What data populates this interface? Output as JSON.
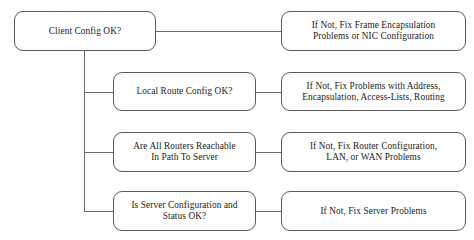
{
  "diagram": {
    "type": "flowchart",
    "canvas": {
      "width": 474,
      "height": 240
    },
    "colors": {
      "background": "#ffffff",
      "node_border": "#5a5a5a",
      "node_fill": "#ffffff",
      "connector": "#6b6b6b",
      "text": "#1a1a1a"
    },
    "questions": [
      {
        "id": "client-config",
        "label": "Client Config OK?",
        "box": {
          "x": 14,
          "y": 11,
          "w": 142,
          "h": 40
        }
      },
      {
        "id": "local-route-config",
        "label": "Local Route Config OK?",
        "box": {
          "x": 113,
          "y": 72,
          "w": 143,
          "h": 39
        }
      },
      {
        "id": "routers-reachable",
        "label": "Are All Routers Reachable\nIn Path To Server",
        "box": {
          "x": 113,
          "y": 132,
          "w": 143,
          "h": 40
        }
      },
      {
        "id": "server-configuration",
        "label": "Is Server Configuration and\nStatus OK?",
        "box": {
          "x": 113,
          "y": 191,
          "w": 143,
          "h": 40
        }
      }
    ],
    "remedies": [
      {
        "id": "fix-frame-encapsulation",
        "label": "If Not, Fix Frame Encapsulation\nProblems or NIC Configuration",
        "box": {
          "x": 281,
          "y": 11,
          "w": 185,
          "h": 40
        }
      },
      {
        "id": "fix-address-encapsulation",
        "label": "If Not, Fix Problems with Address,\nEncapsulation, Access-Lists, Routing",
        "box": {
          "x": 281,
          "y": 72,
          "w": 185,
          "h": 39
        }
      },
      {
        "id": "fix-router-lan-wan",
        "label": "If Not, Fix Router Configuration,\nLAN, or WAN Problems",
        "box": {
          "x": 281,
          "y": 132,
          "w": 185,
          "h": 40
        }
      },
      {
        "id": "fix-server-problems",
        "label": "If Not, Fix Server Problems",
        "box": {
          "x": 281,
          "y": 191,
          "w": 185,
          "h": 40
        }
      }
    ],
    "connectors": [
      {
        "id": "trunk-vertical",
        "orientation": "v",
        "x": 84,
        "y": 51,
        "length": 160
      },
      {
        "id": "client-to-frame-fix",
        "orientation": "h",
        "x": 156,
        "y": 31,
        "length": 125
      },
      {
        "id": "trunk-to-local-route",
        "orientation": "h",
        "x": 84,
        "y": 92,
        "length": 29
      },
      {
        "id": "local-route-to-fix",
        "orientation": "h",
        "x": 256,
        "y": 92,
        "length": 25
      },
      {
        "id": "trunk-to-routers",
        "orientation": "h",
        "x": 84,
        "y": 152,
        "length": 29
      },
      {
        "id": "routers-to-fix",
        "orientation": "h",
        "x": 256,
        "y": 152,
        "length": 25
      },
      {
        "id": "trunk-to-server",
        "orientation": "h",
        "x": 84,
        "y": 211,
        "length": 29
      },
      {
        "id": "server-to-fix",
        "orientation": "h",
        "x": 256,
        "y": 211,
        "length": 25
      }
    ]
  }
}
